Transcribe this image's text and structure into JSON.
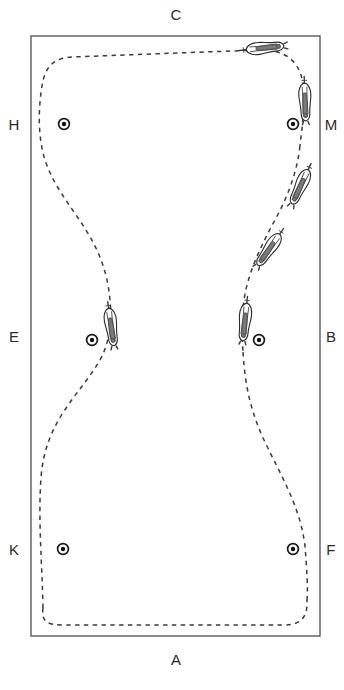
{
  "figure": {
    "kind": "dressage-arena-diagram",
    "width": 344,
    "height": 690,
    "background_color": "#ffffff"
  },
  "arena": {
    "name": "arena-rectangle",
    "x": 31,
    "y": 36,
    "width": 289,
    "height": 600,
    "stroke_color": "#6d6d6d"
  },
  "letters": [
    {
      "id": "C",
      "label": "C",
      "x": 176,
      "y": 20,
      "side": "top"
    },
    {
      "id": "H",
      "label": "H",
      "x": 14,
      "y": 130,
      "side": "left"
    },
    {
      "id": "M",
      "label": "M",
      "x": 331,
      "y": 130,
      "side": "right"
    },
    {
      "id": "E",
      "label": "E",
      "x": 14,
      "y": 342,
      "side": "left"
    },
    {
      "id": "B",
      "label": "B",
      "x": 331,
      "y": 342,
      "side": "right"
    },
    {
      "id": "K",
      "label": "K",
      "x": 14,
      "y": 555,
      "side": "left"
    },
    {
      "id": "F",
      "label": "F",
      "x": 331,
      "y": 555,
      "side": "right"
    },
    {
      "id": "A",
      "label": "A",
      "x": 176,
      "y": 665,
      "side": "bottom"
    }
  ],
  "markers": [
    {
      "id": "marker-H",
      "letter": "H",
      "cx": 64,
      "cy": 124,
      "r_outer": 5.4,
      "r_inner": 2.2
    },
    {
      "id": "marker-M",
      "letter": "M",
      "cx": 293,
      "cy": 124,
      "r_outer": 5.4,
      "r_inner": 2.2
    },
    {
      "id": "marker-E",
      "letter": "E",
      "cx": 92,
      "cy": 340,
      "r_outer": 5.4,
      "r_inner": 2.2
    },
    {
      "id": "marker-B",
      "letter": "B",
      "cx": 259,
      "cy": 340,
      "r_outer": 5.4,
      "r_inner": 2.2
    },
    {
      "id": "marker-K",
      "letter": "K",
      "cx": 63,
      "cy": 549,
      "r_outer": 5.4,
      "r_inner": 2.2
    },
    {
      "id": "marker-F",
      "letter": "F",
      "cx": 293,
      "cy": 549,
      "r_outer": 5.4,
      "r_inner": 2.2
    }
  ],
  "track": {
    "name": "dashed-ridden-track",
    "style": "dashed",
    "stroke_color": "#3b3b3b",
    "dash": "4.4 4.4",
    "segments": [
      {
        "id": "track-upper",
        "d": "M 43 608 C 41 622, 48 625, 62 625 L 284 625 C 300 625, 308 618, 307 600"
      },
      {
        "id": "track-left-loop",
        "d": "M 43 608 C 42 560, 38 520, 41 478 C 45 420, 80 395, 100 360 C 110 342, 112 320, 110 300 C 104 232, 62 210, 45 160 C 38 138, 38 110, 42 86 C 45 66, 54 58, 72 57 L 258 50"
      },
      {
        "id": "track-top-right",
        "d": "M 258 50 C 286 49, 300 62, 303 84 C 306 104, 302 126, 300 146"
      },
      {
        "id": "track-right-descent",
        "d": "M 300 146 C 297 172, 288 196, 276 218 C 262 244, 248 272, 244 300 C 241 322, 242 336, 243 352"
      },
      {
        "id": "track-lower-right",
        "d": "M 243 352 C 245 388, 252 414, 264 440 C 282 478, 300 506, 305 546 C 307 572, 308 588, 307 600"
      }
    ]
  },
  "horses": [
    {
      "id": "horse-top",
      "label": "horse-and-rider-top-track",
      "x": 263,
      "y": 48,
      "rotation": 84,
      "scale": 1.0
    },
    {
      "id": "horse-right-upper",
      "label": "horse-and-rider-right-upper",
      "x": 305,
      "y": 100,
      "rotation": 178,
      "scale": 1.0
    },
    {
      "id": "horse-right-mid",
      "label": "horse-and-rider-right-mid",
      "x": 301,
      "y": 185,
      "rotation": 205,
      "scale": 1.0
    },
    {
      "id": "horse-right-diag",
      "label": "horse-and-rider-right-diagonal",
      "x": 270,
      "y": 248,
      "rotation": 215,
      "scale": 1.0
    },
    {
      "id": "horse-b",
      "label": "horse-and-rider-at-b",
      "x": 245,
      "y": 320,
      "rotation": 186,
      "scale": 1.0
    },
    {
      "id": "horse-e",
      "label": "horse-and-rider-at-e",
      "x": 111,
      "y": 325,
      "rotation": 172,
      "scale": 1.0
    }
  ]
}
